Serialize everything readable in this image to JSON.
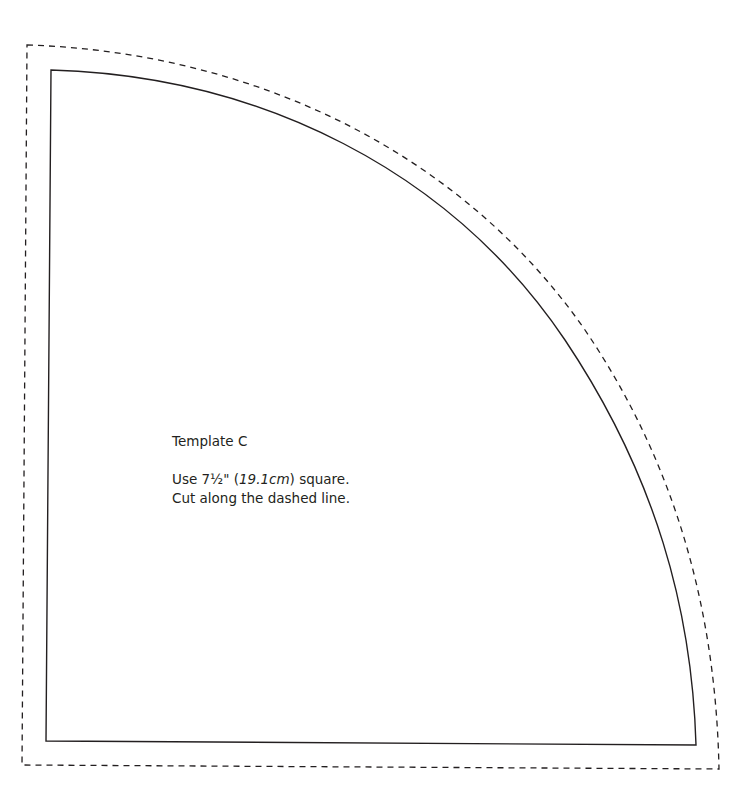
{
  "template": {
    "title": "Template C",
    "instructions": {
      "line1_prefix": "Use 7½\" (",
      "line1_italic": "19.1cm",
      "line1_suffix": ") square.",
      "line2": "Cut along the dashed line."
    }
  },
  "colors": {
    "stroke": "#231f20",
    "background": "#ffffff"
  },
  "shapes": {
    "cut_line": {
      "style": "dashed",
      "top_left": [
        27,
        45
      ],
      "bottom_left": [
        22,
        765
      ],
      "bottom_right": [
        719,
        769
      ]
    },
    "sew_line": {
      "style": "solid",
      "top_left": [
        51,
        70
      ],
      "bottom_left": [
        46,
        741
      ],
      "bottom_right": [
        696,
        745
      ]
    }
  }
}
